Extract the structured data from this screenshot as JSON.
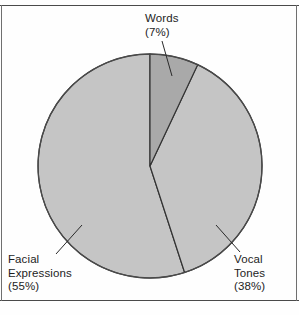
{
  "figure": {
    "background_color": "#fefefe",
    "rule_color": "#4a4a4a"
  },
  "chart_data": {
    "type": "pie",
    "title": "",
    "subtitle": "",
    "xlabel": "",
    "ylabel": "",
    "grid": false,
    "legend_position": "none",
    "labels_position": "outside-with-leader-lines",
    "start_angle_deg": 90,
    "direction": "clockwise",
    "total_percent": 100,
    "categories": [
      "Words",
      "Vocal Tones",
      "Facial Expressions"
    ],
    "values": [
      7,
      38,
      55
    ],
    "units": "percent",
    "slices": [
      {
        "name": "Words",
        "value": 7,
        "value_text": "(7%)",
        "label_line1": "Words",
        "label_line2": "(7%)",
        "color": "#a9a9a9",
        "edge_color": "#333333",
        "start_deg": 90,
        "end_deg": 64.8
      },
      {
        "name": "Vocal Tones",
        "value": 38,
        "value_text": "(38%)",
        "label_line1": "Vocal",
        "label_line2": "Tones",
        "label_line3": "(38%)",
        "color": "#c5c5c5",
        "edge_color": "#333333",
        "start_deg": 64.8,
        "end_deg": -71.999
      },
      {
        "name": "Facial Expressions",
        "value": 55,
        "value_text": "(55%)",
        "label_line1": "Facial",
        "label_line2": "Expressions",
        "label_line3": "(55%)",
        "color": "#c5c5c5",
        "edge_color": "#333333",
        "start_deg": -72,
        "end_deg": -270
      }
    ]
  },
  "labels": {
    "words": {
      "line1": "Words",
      "line2": "(7%)"
    },
    "facial": {
      "line1": "Facial",
      "line2": "Expressions",
      "line3": "(55%)"
    },
    "vocal": {
      "line1": "Vocal",
      "line2": "Tones",
      "line3": "(38%)"
    }
  }
}
